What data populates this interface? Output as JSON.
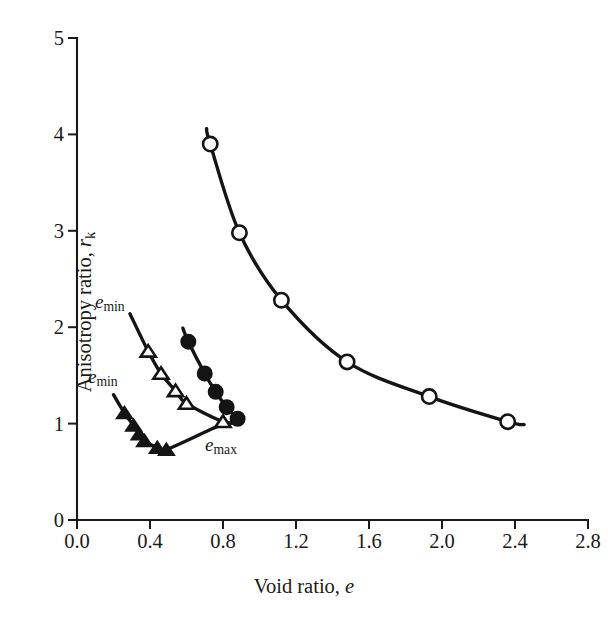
{
  "figure": {
    "background_color": "#ffffff",
    "ink_color": "#141414"
  },
  "axes": {
    "x_title_prefix": "Void ratio, ",
    "x_title_symbol": "e",
    "y_title_prefix": "Anisotropy ratio, ",
    "y_title_symbol": "r",
    "y_title_subscript": "k",
    "x_ticks": [
      "0.0",
      "0.4",
      "0.8",
      "1.2",
      "1.6",
      "2.0",
      "2.4",
      "2.8"
    ],
    "y_ticks": [
      "0",
      "1",
      "2",
      "3",
      "4",
      "5"
    ]
  },
  "annotations": [
    {
      "id": "emin-upper",
      "symbol": "e",
      "subscript": "min",
      "x_px": 95,
      "y_px": 291
    },
    {
      "id": "emin-lower",
      "symbol": "e",
      "subscript": "min",
      "x_px": 88,
      "y_px": 366
    },
    {
      "id": "emax",
      "symbol": "e",
      "subscript": "max",
      "x_px": 205,
      "y_px": 434
    }
  ],
  "chart_data": {
    "type": "line",
    "title": "",
    "xlabel": "Void ratio, e",
    "ylabel": "Anisotropy ratio, r_k",
    "xlim": [
      0.0,
      2.8
    ],
    "ylim": [
      0,
      5
    ],
    "xticks": [
      0.0,
      0.4,
      0.8,
      1.2,
      1.6,
      2.0,
      2.4,
      2.8
    ],
    "yticks": [
      0,
      1,
      2,
      3,
      4,
      5
    ],
    "grid": false,
    "legend": false,
    "series": [
      {
        "name": "open-circle-series",
        "marker": "circle-open",
        "points": [
          {
            "x": 0.73,
            "y": 3.9
          },
          {
            "x": 0.89,
            "y": 2.98
          },
          {
            "x": 1.12,
            "y": 2.28
          },
          {
            "x": 1.48,
            "y": 1.64
          },
          {
            "x": 1.93,
            "y": 1.28
          },
          {
            "x": 2.36,
            "y": 1.02
          }
        ],
        "curve_start": {
          "x": 0.71,
          "y": 4.06
        },
        "curve_end": {
          "x": 2.45,
          "y": 0.99
        }
      },
      {
        "name": "filled-circle-series",
        "marker": "circle-filled",
        "points": [
          {
            "x": 0.61,
            "y": 1.85
          },
          {
            "x": 0.7,
            "y": 1.52
          },
          {
            "x": 0.76,
            "y": 1.33
          },
          {
            "x": 0.82,
            "y": 1.17
          },
          {
            "x": 0.88,
            "y": 1.05
          }
        ],
        "curve_start": {
          "x": 0.58,
          "y": 1.99
        },
        "curve_end": {
          "x": 0.89,
          "y": 1.02
        }
      },
      {
        "name": "open-triangle-series",
        "marker": "triangle-open",
        "points": [
          {
            "x": 0.39,
            "y": 1.75
          },
          {
            "x": 0.46,
            "y": 1.52
          },
          {
            "x": 0.54,
            "y": 1.34
          },
          {
            "x": 0.6,
            "y": 1.21
          },
          {
            "x": 0.8,
            "y": 1.02
          }
        ],
        "curve_start": {
          "x": 0.29,
          "y": 2.14
        },
        "curve_end": {
          "x": 0.89,
          "y": 1.01
        }
      },
      {
        "name": "filled-triangle-series",
        "marker": "triangle-filled",
        "points": [
          {
            "x": 0.26,
            "y": 1.11
          },
          {
            "x": 0.31,
            "y": 0.98
          },
          {
            "x": 0.34,
            "y": 0.89
          },
          {
            "x": 0.37,
            "y": 0.82
          },
          {
            "x": 0.44,
            "y": 0.75
          },
          {
            "x": 0.49,
            "y": 0.73
          }
        ],
        "curve_start": {
          "x": 0.2,
          "y": 1.3
        },
        "curve_end": {
          "x": 0.8,
          "y": 1.0
        }
      }
    ]
  }
}
